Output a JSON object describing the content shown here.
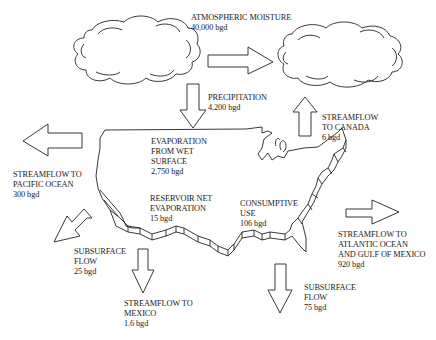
{
  "diagram": {
    "type": "water-budget-flow-diagram",
    "region": "United States",
    "unit": "bgd",
    "labels": {
      "atmospheric_moisture": {
        "lines": [
          "ATMOSPHERIC MOISTURE",
          "40,000 bgd"
        ]
      },
      "precipitation": {
        "lines": [
          "PRECIPITATION",
          "4,200 bgd"
        ]
      },
      "streamflow_canada": {
        "lines": [
          "STREAMFLOW",
          "TO CANADA",
          "6 bgd"
        ]
      },
      "evaporation_wet_surface": {
        "lines": [
          "EVAPORATION",
          "FROM WET",
          "SURFACE",
          "2,750 bgd"
        ]
      },
      "streamflow_pacific": {
        "lines": [
          "STREAMFLOW TO",
          "PACIFIC OCEAN",
          "300 bgd"
        ]
      },
      "reservoir_evaporation": {
        "lines": [
          "RESERVOIR NET",
          "EVAPORATION",
          "15 bgd"
        ]
      },
      "consumptive_use": {
        "lines": [
          "CONSUMPTIVE",
          "USE",
          "106 bgd"
        ]
      },
      "streamflow_atlantic": {
        "lines": [
          "STREAMFLOW TO",
          "ATLANTIC OCEAN",
          "AND GULF OF MEXICO",
          "920 bgd"
        ]
      },
      "subsurface_west": {
        "lines": [
          "SUBSURFACE",
          "FLOW",
          "25 bgd"
        ]
      },
      "streamflow_mexico": {
        "lines": [
          "STREAMFLOW TO",
          "MEXICO",
          "1.6 bgd"
        ]
      },
      "subsurface_south": {
        "lines": [
          "SUBSURFACE",
          "FLOW",
          "75 bgd"
        ]
      }
    },
    "flows": [
      {
        "name": "Atmospheric moisture",
        "value": "40,000 bgd",
        "direction": "west-to-east"
      },
      {
        "name": "Precipitation",
        "value": "4,200 bgd",
        "direction": "down"
      },
      {
        "name": "Streamflow to Canada",
        "value": "6 bgd",
        "direction": "up"
      },
      {
        "name": "Evaporation from wet surface",
        "value": "2,750 bgd"
      },
      {
        "name": "Streamflow to Pacific Ocean",
        "value": "300 bgd",
        "direction": "left"
      },
      {
        "name": "Reservoir net evaporation",
        "value": "15 bgd"
      },
      {
        "name": "Consumptive use",
        "value": "106 bgd"
      },
      {
        "name": "Streamflow to Atlantic Ocean and Gulf of Mexico",
        "value": "920 bgd",
        "direction": "right"
      },
      {
        "name": "Subsurface flow (west)",
        "value": "25 bgd",
        "direction": "down-left"
      },
      {
        "name": "Streamflow to Mexico",
        "value": "1.6 bgd",
        "direction": "down"
      },
      {
        "name": "Subsurface flow (south)",
        "value": "75 bgd",
        "direction": "down"
      }
    ]
  }
}
